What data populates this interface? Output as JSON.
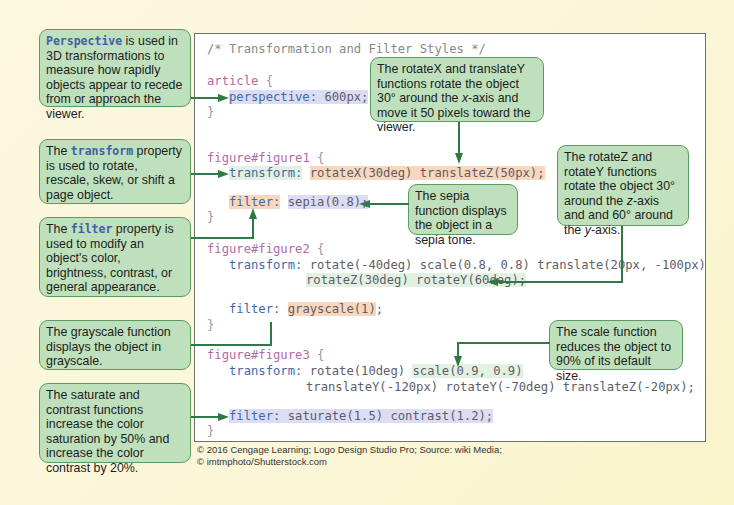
{
  "code": {
    "comment": "/* Transformation and Filter Styles */",
    "article": {
      "selector": "article",
      "open": " {",
      "perspective_prop": "perspective:",
      "perspective_val": " 600px;",
      "close": "}"
    },
    "figure1": {
      "selector": "figure#figure1",
      "open": " {",
      "transform_prop": "transform:",
      "transform_val": "rotateX(30deg) translateZ(50px);",
      "filter_prop": "filter:",
      "filter_val": "sepia(0.8);",
      "close": "}"
    },
    "figure2": {
      "selector": "figure#figure2",
      "open": " {",
      "transform_prop": "transform:",
      "transform_val1": "rotate(-40deg) scale(0.8, 0.8) translate(20px, -100px)",
      "transform_val2": "rotateZ(30deg) rotateY(60deg);",
      "filter_prop": "filter:",
      "filter_val": "grayscale(1)",
      "filter_end": ";",
      "close": "}"
    },
    "figure3": {
      "selector": "figure#figure3",
      "open": " {",
      "transform_prop": "transform:",
      "transform_val1a": "rotate(10deg) ",
      "transform_val1b": "scale(0.9, 0.9)",
      "transform_val2": "translateY(-120px) rotateY(-70deg) translateZ(-20px);",
      "filter_prop": "filter:",
      "filter_val": " saturate(1.5) contrast(1.2);",
      "close": "}"
    }
  },
  "notes": {
    "perspective": {
      "keyword": "Perspective",
      "text": " is used in 3D transformations to measure how rapidly objects appear to recede from or approach the viewer."
    },
    "transform": {
      "pre": "The ",
      "keyword": "transform",
      "text": " property is used to rotate, rescale, skew, or shift a page object."
    },
    "filter": {
      "pre": "The ",
      "keyword": "filter",
      "text": " property is used to modify an object's color, brightness, contrast, or general appearance."
    },
    "grayscale": {
      "text": "The grayscale function displays the object in grayscale."
    },
    "saturate": {
      "text": "The saturate and contrast functions increase the color saturation by 50% and increase the color contrast by 20%."
    },
    "rotateX": {
      "text1": "The rotateX and translateY functions rotate the object 30° around the ",
      "axis": "x",
      "text2": "-axis and move it 50 pixels toward the viewer."
    },
    "sepia": {
      "text": "The sepia function displays the object in a sepia tone."
    },
    "rotateZ": {
      "text1": "The rotateZ and rotateY functions rotate the object 30° around the ",
      "axis1": "z",
      "text2": "-axis and and 60° around the ",
      "axis2": "y",
      "text3": "-axis."
    },
    "scale": {
      "text": "The scale function reduces the object to 90% of its default size."
    }
  },
  "credit": {
    "line1": "© 2016 Cengage Learning; Logo Design Studio Pro; Source: wiki Media;",
    "line2": "© imtmphoto/Shutterstock.com"
  },
  "colors": {
    "note_bg": "#bfe0bc",
    "note_border": "#5c9a63",
    "arrow": "#2f7a44",
    "selector": "#b26aa7",
    "property": "#3c6aa8",
    "highlight_blue": "#dcdcf4",
    "highlight_orange": "#fad6bd",
    "highlight_green": "#e2f1e2"
  }
}
